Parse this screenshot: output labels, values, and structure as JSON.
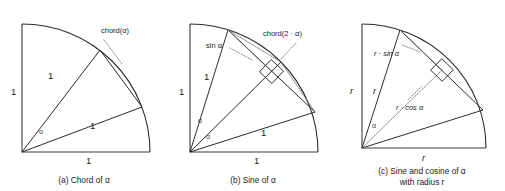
{
  "figure": {
    "background_color": "#ffffff",
    "line_color": "#2b2b2b",
    "dotted_color": "#6b6b6b",
    "alpha_symbol": "α",
    "dot_operator": "·"
  },
  "panels": [
    {
      "id": "a",
      "caption_line1": "(a) Chord of α",
      "caption_line2": "",
      "labels": {
        "vertical_side": "1",
        "horizontal_side": "1",
        "radius_upper": "1",
        "radius_lower": "1",
        "chord": "chord(α)",
        "angle": "α"
      }
    },
    {
      "id": "b",
      "caption_line1": "(b) Sine of α",
      "caption_line2": "",
      "labels": {
        "vertical_side": "1",
        "horizontal_side": "1",
        "radius_upper": "1",
        "radius_lower": "1",
        "chord": "chord(2 · α)",
        "sine": "sin α",
        "angle_upper": "α",
        "angle_lower": "α"
      }
    },
    {
      "id": "c",
      "caption_line1": "(c) Sine and cosine of α",
      "caption_line2": "with radius r",
      "labels": {
        "vertical_side": "r",
        "horizontal_side": "r",
        "radius": "r",
        "sine": "r · sin α",
        "cosine": "r · cos α",
        "angle": "α"
      }
    }
  ]
}
